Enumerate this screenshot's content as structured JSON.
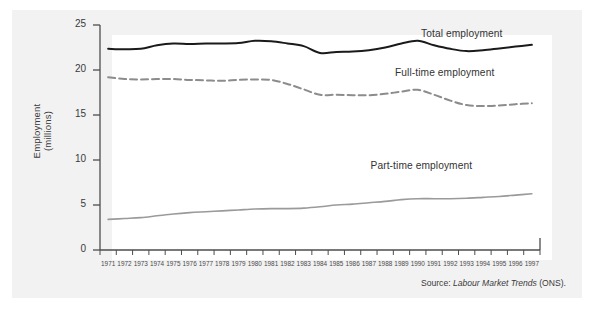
{
  "figure": {
    "source_prefix": "Source: ",
    "source_italic": "Labour Market Trends",
    "source_suffix": " (ONS).",
    "panel_color": "#f2f2f2",
    "plot_background": "#ffffff"
  },
  "chart_data": {
    "type": "line",
    "title": "",
    "xlabel": "",
    "ylabel": "Employment\n(millions)",
    "ylabel_line1": "Employment",
    "ylabel_line2": "(millions)",
    "ylim": [
      0,
      25
    ],
    "yticks": [
      0,
      5,
      10,
      15,
      20,
      25
    ],
    "ytick_labels": [
      "0",
      "5",
      "10",
      "15",
      "20",
      "25"
    ],
    "grid": false,
    "legend": "inline-labels",
    "categories": [
      "1971",
      "1972",
      "1973",
      "1974",
      "1975",
      "1976",
      "1977",
      "1978",
      "1979",
      "1980",
      "1981",
      "1982",
      "1983",
      "1984",
      "1985",
      "1986",
      "1987",
      "1988",
      "1989",
      "1990",
      "1991",
      "1992",
      "1993",
      "1994",
      "1995",
      "1996",
      "1997"
    ],
    "series": [
      {
        "name": "Total employment",
        "style": "solid",
        "color": "#1a1a1a",
        "width": 2.0,
        "label_x": 1990.2,
        "label_y": 23.9,
        "values": [
          22.35,
          22.3,
          22.35,
          22.75,
          22.95,
          22.9,
          22.95,
          22.95,
          23.0,
          23.25,
          23.2,
          22.95,
          22.65,
          21.9,
          22.0,
          22.05,
          22.2,
          22.5,
          22.95,
          23.25,
          22.75,
          22.35,
          22.1,
          22.2,
          22.4,
          22.6,
          22.8
        ]
      },
      {
        "name": "Full-time employment",
        "style": "dashed",
        "color": "#8c8c8c",
        "width": 2.0,
        "label_x": 1988.6,
        "label_y": 19.55,
        "values": [
          19.2,
          19.0,
          18.95,
          19.0,
          19.0,
          18.9,
          18.85,
          18.8,
          18.9,
          18.95,
          18.9,
          18.45,
          17.85,
          17.25,
          17.25,
          17.2,
          17.2,
          17.35,
          17.6,
          17.8,
          17.25,
          16.6,
          16.1,
          16.0,
          16.05,
          16.2,
          16.3
        ]
      },
      {
        "name": "Part-time employment",
        "style": "solid",
        "color": "#9a9a9a",
        "width": 1.6,
        "label_x": 1987.1,
        "label_y": 9.2,
        "values": [
          3.4,
          3.5,
          3.6,
          3.8,
          4.0,
          4.15,
          4.25,
          4.35,
          4.45,
          4.55,
          4.6,
          4.6,
          4.65,
          4.8,
          5.0,
          5.1,
          5.25,
          5.4,
          5.6,
          5.7,
          5.7,
          5.7,
          5.75,
          5.85,
          5.95,
          6.1,
          6.25
        ]
      }
    ]
  }
}
